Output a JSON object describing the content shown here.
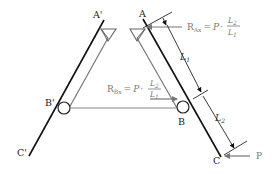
{
  "diagram": {
    "type": "mechanics-free-body",
    "points": {
      "A_prime": "A'",
      "B_prime": "B'",
      "C_prime": "C'",
      "A": "A",
      "B": "B",
      "C": "C"
    },
    "forces": {
      "P": {
        "label": "P",
        "color": "#777777"
      },
      "R_Ax": {
        "lhs": "R",
        "lhs_sub": "Ax",
        "eq": "=",
        "P": "P",
        "dot": "·",
        "num": "L",
        "num_sub": "2",
        "den": "L",
        "den_sub": "1"
      },
      "R_Bx": {
        "lhs": "R",
        "lhs_sub": "Bx",
        "eq": "=",
        "P": "P",
        "dot": "·",
        "num": "L",
        "num_sub": "2",
        "den": "L",
        "den_sub": "1"
      }
    },
    "dimensions": {
      "L1": {
        "main": "L",
        "sub": "1"
      },
      "L2": {
        "main": "L",
        "sub": "2"
      }
    },
    "colors": {
      "member": "#111111",
      "brace": "#777777",
      "force": "#777777"
    }
  }
}
